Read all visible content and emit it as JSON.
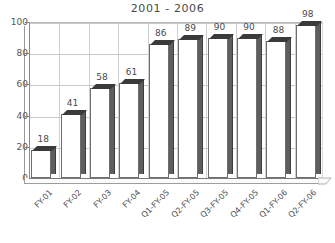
{
  "chart_data": {
    "type": "bar",
    "title": "2001 - 2006",
    "xlabel": "",
    "ylabel": "",
    "ylim": [
      0,
      100
    ],
    "yticks": [
      0,
      20,
      40,
      60,
      80,
      100
    ],
    "grid": "horizontal-and-vertical",
    "legend": "none",
    "categories": [
      "FY-01",
      "FY-02",
      "FY-03",
      "FY-04",
      "Q1-FY-05",
      "Q2-FY-05",
      "Q3-FY-05",
      "Q4-FY-05",
      "Q1-FY-06",
      "Q2-FY-06"
    ],
    "values": [
      18,
      41,
      58,
      61,
      86,
      89,
      90,
      90,
      88,
      98
    ],
    "data_labels": [
      "18",
      "41",
      "58",
      "61",
      "86",
      "89",
      "90",
      "90",
      "88",
      "98"
    ],
    "ytick_labels": [
      "0",
      "20",
      "40",
      "60",
      "80",
      "100"
    ],
    "colors": {
      "bar_face": "#ffffff",
      "bar_outline": "#6e6e6e",
      "bar_side": "#5e5e5e",
      "bar_top": "#3a3a3a",
      "gridline": "#c9c9c9",
      "axis": "#7d7d7d",
      "text": "#4a4a4a",
      "background": "#ffffff"
    }
  }
}
